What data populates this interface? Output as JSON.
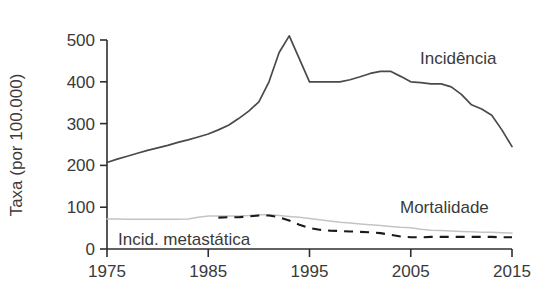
{
  "chart_data": {
    "type": "line",
    "title": "",
    "xlabel": "",
    "ylabel": "Taxa (por 100.000)",
    "xlim": [
      1975,
      2015
    ],
    "ylim": [
      0,
      500
    ],
    "grid": false,
    "legend_position": "inline-right",
    "x_ticks": [
      "1975",
      "1985",
      "1995",
      "2005",
      "2015"
    ],
    "x_tick_values": [
      1975,
      1985,
      1995,
      2005,
      2015
    ],
    "y_ticks": [
      "0",
      "100",
      "200",
      "300",
      "400",
      "500"
    ],
    "y_tick_values": [
      0,
      100,
      200,
      300,
      400,
      500
    ],
    "series": [
      {
        "name": "Incidência",
        "style": "solid",
        "color": "#4a4a4a",
        "x": [
          1975,
          1976,
          1977,
          1978,
          1979,
          1980,
          1981,
          1982,
          1983,
          1984,
          1985,
          1986,
          1987,
          1988,
          1989,
          1990,
          1991,
          1992,
          1993,
          1994,
          1995,
          1996,
          1997,
          1998,
          1999,
          2000,
          2001,
          2002,
          2003,
          2004,
          2005,
          2006,
          2007,
          2008,
          2009,
          2010,
          2011,
          2012,
          2013,
          2014,
          2015
        ],
        "values": [
          207,
          215,
          222,
          229,
          236,
          242,
          248,
          255,
          261,
          268,
          275,
          285,
          296,
          312,
          330,
          352,
          400,
          470,
          510,
          455,
          400,
          400,
          400,
          400,
          405,
          412,
          420,
          425,
          425,
          413,
          400,
          398,
          395,
          395,
          388,
          370,
          345,
          335,
          320,
          285,
          245
        ]
      },
      {
        "name": "Mortalidade",
        "style": "solid",
        "color": "#c4c4c4",
        "x": [
          1975,
          1976,
          1977,
          1978,
          1979,
          1980,
          1981,
          1982,
          1983,
          1984,
          1985,
          1986,
          1987,
          1988,
          1989,
          1990,
          1991,
          1992,
          1993,
          1994,
          1995,
          1996,
          1997,
          1998,
          1999,
          2000,
          2001,
          2002,
          2003,
          2004,
          2005,
          2006,
          2007,
          2008,
          2009,
          2010,
          2011,
          2012,
          2013,
          2014,
          2015
        ],
        "values": [
          72,
          72,
          71,
          71,
          71,
          71,
          71,
          71,
          72,
          76,
          79,
          79,
          79,
          79,
          80,
          82,
          82,
          80,
          78,
          76,
          73,
          70,
          67,
          64,
          62,
          60,
          58,
          56,
          54,
          52,
          51,
          47,
          45,
          44,
          43,
          42,
          41,
          40,
          40,
          39,
          38
        ]
      },
      {
        "name": "Incid. metastática",
        "style": "dashed",
        "color": "#1a1a1a",
        "x": [
          1986,
          1987,
          1988,
          1989,
          1990,
          1991,
          1992,
          1993,
          1994,
          1995,
          1996,
          1997,
          1998,
          1999,
          2000,
          2001,
          2002,
          2003,
          2004,
          2005,
          2006,
          2007,
          2008,
          2009,
          2010,
          2011,
          2012,
          2013,
          2014,
          2015
        ],
        "values": [
          75,
          76,
          76,
          78,
          80,
          80,
          76,
          68,
          58,
          50,
          46,
          44,
          43,
          42,
          41,
          40,
          38,
          34,
          30,
          28,
          28,
          29,
          29,
          29,
          29,
          29,
          29,
          29,
          28,
          28
        ]
      }
    ],
    "annotations": [
      {
        "name": "incidencia-label",
        "text": "Incidência",
        "x": 1986,
        "y": 440
      },
      {
        "name": "mortalidade-label",
        "text": "Mortalidade",
        "x": 2004,
        "y": 128
      },
      {
        "name": "metastatica-label",
        "text": "Incid. metastática",
        "x": 1982,
        "y": 28
      }
    ]
  },
  "axis": {
    "y_title": "Taxa (por 100.000)"
  },
  "colors": {
    "incidence": "#4a4a4a",
    "mortality": "#c4c4c4",
    "metastatic": "#1a1a1a",
    "axis": "#2e2e2e",
    "text": "#3a3a3a",
    "background": "#ffffff"
  }
}
